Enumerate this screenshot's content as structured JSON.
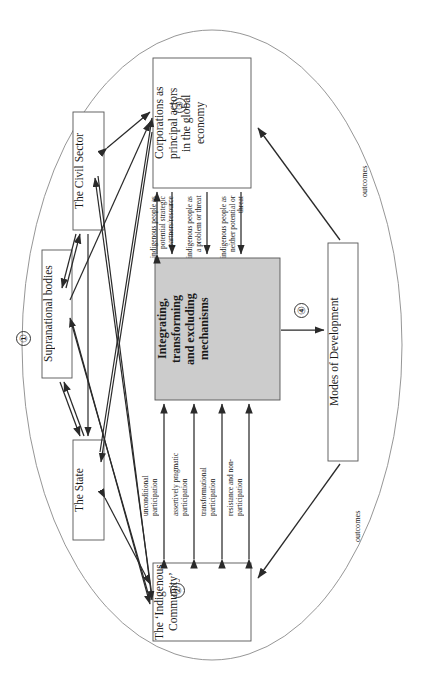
{
  "diagram": {
    "title_visible": false,
    "outer_boundary": {
      "shape": "ellipse",
      "marker": "①"
    },
    "nodes": [
      {
        "id": "civil_sector",
        "label": "The Civil Sector",
        "marker": ""
      },
      {
        "id": "supranational",
        "label": "Supranational bodies",
        "marker": ""
      },
      {
        "id": "state",
        "label": "The State",
        "marker": ""
      },
      {
        "id": "corporations",
        "label": "Corporations as\nprincipal actors\nin the global\neconomy",
        "marker": "③"
      },
      {
        "id": "mechanisms",
        "label": "Integrating,\ntransforming\nand excluding\nmechanisms",
        "marker": "④",
        "fill": "#cccccc"
      },
      {
        "id": "indigenous",
        "label": "The ‘Indigenous\nCommunity’",
        "marker": "②"
      },
      {
        "id": "modes",
        "label": "Modes of Development",
        "marker": ""
      }
    ],
    "top_edge_labels": [
      "indigenous people as\npotential strategic\npartners/resource",
      "indigenous people as\na problem or threat",
      "indigenous people as\nneither potential or\nthreat"
    ],
    "bottom_edge_labels": [
      "unconditional\nparticipation",
      "assertively pragmatic\nparticipation",
      "transformational\nparticipation",
      "resistance and non-\nparticipation"
    ],
    "outcome_labels": [
      "outcomes",
      "outcomes"
    ],
    "colors": {
      "gray_fill": "#cccccc",
      "stroke": "#2a2a2a",
      "ellipse_stroke": "#888888"
    }
  }
}
